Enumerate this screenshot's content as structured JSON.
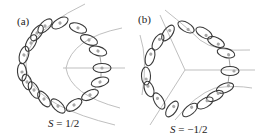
{
  "figure": {
    "panels": [
      {
        "id": "a",
        "label": "(a)",
        "caption_symbol": "S",
        "caption_eq": " = ",
        "caption_value": "1/2"
      },
      {
        "id": "b",
        "label": "(b)",
        "caption_symbol": "S",
        "caption_eq": " = ",
        "caption_value": "−1/2"
      }
    ],
    "colors": {
      "ellipse_stroke": "#3a3a3a",
      "dot_fill": "#a8a8a8",
      "guide_line": "#b8b8b8",
      "background": "#ffffff"
    }
  }
}
